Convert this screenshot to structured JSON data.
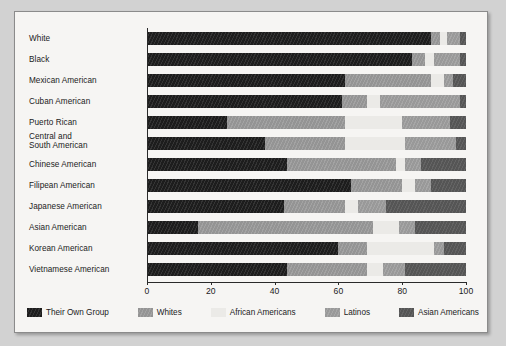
{
  "chart_data": {
    "type": "bar",
    "orientation": "horizontal",
    "stacked": true,
    "title": "",
    "xlabel": "",
    "ylabel": "",
    "xlim": [
      0,
      100
    ],
    "xticks": [
      0,
      20,
      40,
      60,
      80,
      100
    ],
    "xtick_labels": [
      "0",
      "20",
      "40",
      "60",
      "80",
      "100"
    ],
    "grid": false,
    "legend_position": "bottom",
    "categories": [
      "White",
      "Black",
      "Mexican American",
      "Cuban American",
      "Puerto Rican",
      "Central and South American",
      "Chinese American",
      "Filipean American",
      "Japanese American",
      "Asian American",
      "Korean American",
      "Vietnamese American"
    ],
    "category_labels": [
      [
        "White"
      ],
      [
        "Black"
      ],
      [
        "Mexican American"
      ],
      [
        "Cuban American"
      ],
      [
        "Puerto Rican"
      ],
      [
        "Central and",
        "South American"
      ],
      [
        "Chinese American"
      ],
      [
        "Filipean American"
      ],
      [
        "Japanese American"
      ],
      [
        "Asian American"
      ],
      [
        "Korean American"
      ],
      [
        "Vietnamese American"
      ]
    ],
    "series": [
      {
        "name": "Their Own Group",
        "color": "#262626",
        "values": [
          89,
          83,
          62,
          61,
          25,
          37,
          44,
          64,
          43,
          16,
          60,
          44
        ]
      },
      {
        "name": "Whites",
        "color": "#9a9a9a",
        "values": [
          3,
          4,
          27,
          8,
          37,
          25,
          34,
          16,
          19,
          55,
          9,
          25
        ]
      },
      {
        "name": "African Americans",
        "color": "#ebeae7",
        "values": [
          2,
          3,
          4,
          4,
          18,
          19,
          3,
          4,
          4,
          8,
          21,
          5
        ]
      },
      {
        "name": "Latinos",
        "color": "#9e9e9e",
        "values": [
          4,
          8,
          3,
          25,
          15,
          16,
          5,
          5,
          9,
          5,
          3,
          7
        ]
      },
      {
        "name": "Asian Americans",
        "color": "#5b5b5b",
        "values": [
          2,
          2,
          4,
          2,
          5,
          3,
          14,
          11,
          25,
          16,
          7,
          19
        ]
      }
    ]
  },
  "legend": {
    "items": [
      {
        "label": "Their Own Group",
        "swatch": "s-own"
      },
      {
        "label": "Whites",
        "swatch": "s-whites"
      },
      {
        "label": "African Americans",
        "swatch": "s-african"
      },
      {
        "label": "Latinos",
        "swatch": "s-latinos"
      },
      {
        "label": "Asian Americans",
        "swatch": "s-asian"
      }
    ]
  }
}
